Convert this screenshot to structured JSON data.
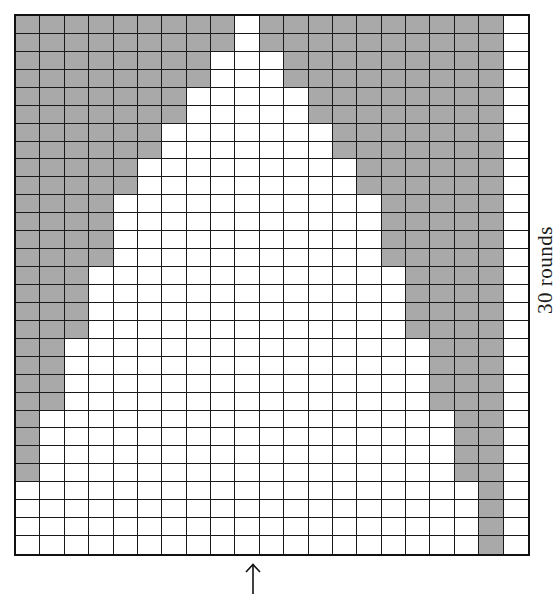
{
  "diagram": {
    "type": "knitting-chart",
    "columns": 21,
    "rows": 30,
    "colors": {
      "shaded": "#a9a9a9",
      "unshaded": "#ffffff",
      "gridline": "#1a1a1a"
    },
    "legend": {
      "side_label": "30 rounds",
      "bottom_marker": "up-arrow",
      "bottom_marker_column": 10
    },
    "shaded_cells_by_row": [
      {
        "row": 1,
        "shaded_columns": [
          1,
          2,
          3,
          4,
          5,
          6,
          7,
          8,
          9,
          11,
          12,
          13,
          14,
          15,
          16,
          17,
          18,
          19,
          20
        ]
      },
      {
        "row": 2,
        "shaded_columns": [
          1,
          2,
          3,
          4,
          5,
          6,
          7,
          8,
          9,
          11,
          12,
          13,
          14,
          15,
          16,
          17,
          18,
          19,
          20
        ]
      },
      {
        "row": 3,
        "shaded_columns": [
          1,
          2,
          3,
          4,
          5,
          6,
          7,
          8,
          12,
          13,
          14,
          15,
          16,
          17,
          18,
          19,
          20
        ]
      },
      {
        "row": 4,
        "shaded_columns": [
          1,
          2,
          3,
          4,
          5,
          6,
          7,
          8,
          12,
          13,
          14,
          15,
          16,
          17,
          18,
          19,
          20
        ]
      },
      {
        "row": 5,
        "shaded_columns": [
          1,
          2,
          3,
          4,
          5,
          6,
          7,
          13,
          14,
          15,
          16,
          17,
          18,
          19,
          20
        ]
      },
      {
        "row": 6,
        "shaded_columns": [
          1,
          2,
          3,
          4,
          5,
          6,
          7,
          13,
          14,
          15,
          16,
          17,
          18,
          19,
          20
        ]
      },
      {
        "row": 7,
        "shaded_columns": [
          1,
          2,
          3,
          4,
          5,
          6,
          14,
          15,
          16,
          17,
          18,
          19,
          20
        ]
      },
      {
        "row": 8,
        "shaded_columns": [
          1,
          2,
          3,
          4,
          5,
          6,
          14,
          15,
          16,
          17,
          18,
          19,
          20
        ]
      },
      {
        "row": 9,
        "shaded_columns": [
          1,
          2,
          3,
          4,
          5,
          15,
          16,
          17,
          18,
          19,
          20
        ]
      },
      {
        "row": 10,
        "shaded_columns": [
          1,
          2,
          3,
          4,
          5,
          15,
          16,
          17,
          18,
          19,
          20
        ]
      },
      {
        "row": 11,
        "shaded_columns": [
          1,
          2,
          3,
          4,
          16,
          17,
          18,
          19,
          20
        ]
      },
      {
        "row": 12,
        "shaded_columns": [
          1,
          2,
          3,
          4,
          16,
          17,
          18,
          19,
          20
        ]
      },
      {
        "row": 13,
        "shaded_columns": [
          1,
          2,
          3,
          4,
          16,
          17,
          18,
          19,
          20
        ]
      },
      {
        "row": 14,
        "shaded_columns": [
          1,
          2,
          3,
          4,
          16,
          17,
          18,
          19,
          20
        ]
      },
      {
        "row": 15,
        "shaded_columns": [
          1,
          2,
          3,
          17,
          18,
          19,
          20
        ]
      },
      {
        "row": 16,
        "shaded_columns": [
          1,
          2,
          3,
          17,
          18,
          19,
          20
        ]
      },
      {
        "row": 17,
        "shaded_columns": [
          1,
          2,
          3,
          17,
          18,
          19,
          20
        ]
      },
      {
        "row": 18,
        "shaded_columns": [
          1,
          2,
          3,
          17,
          18,
          19,
          20
        ]
      },
      {
        "row": 19,
        "shaded_columns": [
          1,
          2,
          18,
          19,
          20
        ]
      },
      {
        "row": 20,
        "shaded_columns": [
          1,
          2,
          18,
          19,
          20
        ]
      },
      {
        "row": 21,
        "shaded_columns": [
          1,
          2,
          18,
          19,
          20
        ]
      },
      {
        "row": 22,
        "shaded_columns": [
          1,
          2,
          18,
          19,
          20
        ]
      },
      {
        "row": 23,
        "shaded_columns": [
          1,
          19,
          20
        ]
      },
      {
        "row": 24,
        "shaded_columns": [
          1,
          19,
          20
        ]
      },
      {
        "row": 25,
        "shaded_columns": [
          1,
          19,
          20
        ]
      },
      {
        "row": 26,
        "shaded_columns": [
          1,
          19,
          20
        ]
      },
      {
        "row": 27,
        "shaded_columns": [
          20
        ]
      },
      {
        "row": 28,
        "shaded_columns": [
          20
        ]
      },
      {
        "row": 29,
        "shaded_columns": [
          20
        ]
      },
      {
        "row": 30,
        "shaded_columns": [
          20
        ]
      }
    ]
  }
}
